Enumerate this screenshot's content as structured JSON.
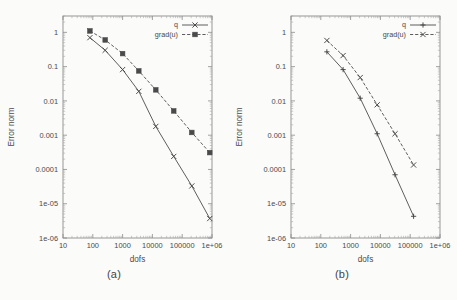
{
  "figure": {
    "background_color": "#fbfbfa",
    "ink_color": "#4a4a4a"
  },
  "panels": [
    {
      "id": "a",
      "caption": "(a)"
    },
    {
      "id": "b",
      "caption": "(b)"
    }
  ],
  "chart_data": [
    {
      "type": "line",
      "panel": "a",
      "caption": "(a)",
      "title": "",
      "xlabel": "dofs",
      "ylabel": "Error norm",
      "xscale": "log",
      "yscale": "log",
      "xlim": [
        10,
        1000000
      ],
      "ylim": [
        1e-06,
        3
      ],
      "grid": false,
      "legend_position": "top-right",
      "xticklabels": [
        "10",
        "100",
        "1000",
        "10000",
        "100000",
        "1e+06"
      ],
      "xtickvalues": [
        10,
        100,
        1000,
        10000,
        100000,
        1000000
      ],
      "yticklabels": [
        "1e-06",
        "1e-05",
        "0.0001",
        "0.001",
        "0.01",
        "0.1",
        "1"
      ],
      "ytickvalues": [
        1e-06,
        1e-05,
        0.0001,
        0.001,
        0.01,
        0.1,
        1
      ],
      "series": [
        {
          "name": "q",
          "linestyle": "solid",
          "marker": "x",
          "x": [
            80,
            260,
            1000,
            3500,
            13000,
            52000,
            210000,
            840000
          ],
          "y": [
            0.7,
            0.3,
            0.082,
            0.019,
            0.0018,
            0.00024,
            3.3e-05,
            3.7e-06
          ]
        },
        {
          "name": "grad(u)",
          "linestyle": "dashed",
          "marker": "filled-square",
          "x": [
            80,
            260,
            1000,
            3500,
            13000,
            52000,
            210000,
            840000
          ],
          "y": [
            1.1,
            0.6,
            0.24,
            0.075,
            0.021,
            0.0051,
            0.0012,
            0.00031
          ]
        }
      ]
    },
    {
      "type": "line",
      "panel": "b",
      "caption": "(b)",
      "title": "",
      "xlabel": "dofs",
      "ylabel": "Error norm",
      "xscale": "log",
      "yscale": "log",
      "xlim": [
        10,
        1000000
      ],
      "ylim": [
        1e-06,
        3
      ],
      "grid": false,
      "legend_position": "top-right",
      "xticklabels": [
        "10",
        "100",
        "1000",
        "10000",
        "100000",
        "1e+06"
      ],
      "xtickvalues": [
        10,
        100,
        1000,
        10000,
        100000,
        1000000
      ],
      "yticklabels": [
        "1e-06",
        "1e-05",
        "0.0001",
        "0.001",
        "0.01",
        "0.1",
        "1"
      ],
      "ytickvalues": [
        1e-06,
        1e-05,
        0.0001,
        0.001,
        0.01,
        0.1,
        1
      ],
      "series": [
        {
          "name": "q",
          "linestyle": "solid",
          "marker": "plus",
          "x": [
            160,
            560,
            2100,
            7800,
            31000,
            130000
          ],
          "y": [
            0.27,
            0.082,
            0.012,
            0.0011,
            7e-05,
            4.3e-06
          ]
        },
        {
          "name": "grad(u)",
          "linestyle": "dashed",
          "marker": "x",
          "x": [
            160,
            560,
            2100,
            7800,
            31000,
            130000
          ],
          "y": [
            0.58,
            0.21,
            0.048,
            0.0077,
            0.0011,
            0.000135
          ]
        }
      ]
    }
  ]
}
